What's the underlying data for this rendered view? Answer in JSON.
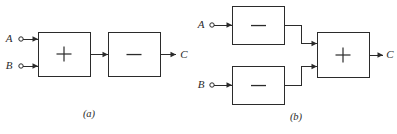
{
  "figure": {
    "background_color": "#ffffff",
    "line_color": "#2b2b2b",
    "width": 397,
    "height": 134
  },
  "panels": [
    {
      "id": "panel-a",
      "caption": "(a)",
      "inputs": [
        {
          "label": "A",
          "terminal": "open-circle"
        },
        {
          "label": "B",
          "terminal": "open-circle"
        }
      ],
      "blocks": [
        {
          "id": "a-block-1",
          "operator": "+",
          "operator_name": "plus-sign"
        },
        {
          "id": "a-block-2",
          "operator": "−",
          "operator_name": "minus-sign"
        }
      ],
      "outputs": [
        {
          "label": "C"
        }
      ]
    },
    {
      "id": "panel-b",
      "caption": "(b)",
      "inputs": [
        {
          "label": "A",
          "terminal": "open-circle"
        },
        {
          "label": "B",
          "terminal": "open-circle"
        }
      ],
      "blocks": [
        {
          "id": "b-block-top",
          "operator": "−",
          "operator_name": "minus-sign"
        },
        {
          "id": "b-block-bottom",
          "operator": "−",
          "operator_name": "minus-sign"
        },
        {
          "id": "b-block-sum",
          "operator": "+",
          "operator_name": "plus-sign"
        }
      ],
      "outputs": [
        {
          "label": "C"
        }
      ]
    }
  ]
}
